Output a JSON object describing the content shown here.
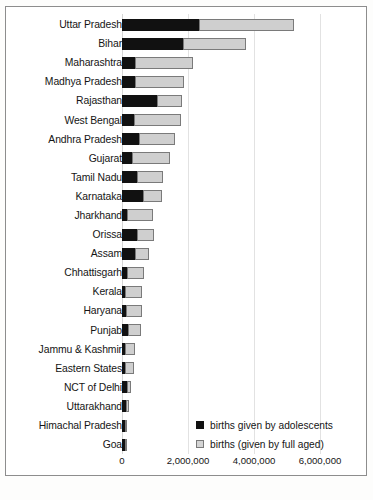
{
  "chart_data": {
    "type": "bar",
    "orientation": "horizontal",
    "stacked": true,
    "title": "",
    "subtitle": "",
    "xlabel": "",
    "ylabel": "",
    "xlim": [
      0,
      6800000
    ],
    "xticks": [
      0,
      2000000,
      4000000,
      6000000
    ],
    "xtick_labels": [
      "0",
      "2,000,000",
      "4,000,000",
      "6,000,000"
    ],
    "grid": true,
    "grid_axis": "x",
    "legend_position": "bottom-right",
    "categories": [
      "Uttar Pradesh",
      "Bihar",
      "Maharashtra",
      "Madhya Pradesh",
      "Rajasthan",
      "West Bengal",
      "Andhra Pradesh",
      "Gujarat",
      "Tamil Nadu",
      "Karnataka",
      "Jharkhand",
      "Orissa",
      "Assam",
      "Chhattisgarh",
      "Kerala",
      "Haryana",
      "Punjab",
      "Jammu & Kashmir",
      "Eastern States",
      "NCT of Delhi",
      "Uttarakhand",
      "Himachal Pradesh",
      "Goa"
    ],
    "series": [
      {
        "name": "births given by adolescents",
        "color": "#111111",
        "values": [
          2330000,
          1850000,
          390000,
          390000,
          1060000,
          360000,
          510000,
          300000,
          450000,
          640000,
          150000,
          450000,
          390000,
          150000,
          30000,
          120000,
          180000,
          30000,
          15000,
          150000,
          120000,
          15000,
          45000
        ]
      },
      {
        "name": "births (given by full aged)",
        "color": "#cfcfcf",
        "values": [
          2880000,
          1910000,
          1760000,
          1490000,
          760000,
          1420000,
          1100000,
          1150000,
          790000,
          570000,
          790000,
          520000,
          430000,
          520000,
          545000,
          485000,
          395000,
          305000,
          290000,
          120000,
          90000,
          90000,
          15000
        ]
      }
    ]
  },
  "legend": {
    "items": [
      {
        "label": "births given by adolescents",
        "swatch": "black-square"
      },
      {
        "label": "births (given by full aged)",
        "swatch": "gray-square"
      }
    ]
  }
}
